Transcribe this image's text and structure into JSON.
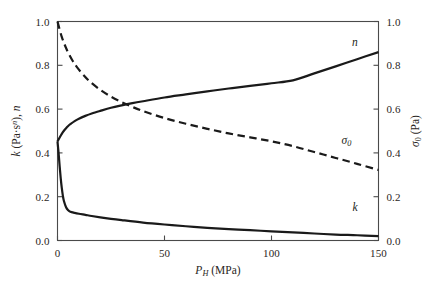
{
  "chart_data": {
    "type": "line",
    "title": "",
    "subtitle": "",
    "xlabel": "P_H (MPa)",
    "ylabel": "k (Pa·s^n), n",
    "y2label": "σ₀ (Pa)",
    "xlim": [
      0,
      150
    ],
    "ylim": [
      0.0,
      1.0
    ],
    "y2lim": [
      0.0,
      1.0
    ],
    "grid": false,
    "legend": "none",
    "legend_position": "inline-annotations",
    "xticks": [
      0,
      50,
      100,
      150
    ],
    "xtick_labels": [
      "0",
      "50",
      "100",
      "150"
    ],
    "yticks": [
      0.0,
      0.2,
      0.4,
      0.6,
      0.8,
      1.0
    ],
    "ytick_labels": [
      "0.0",
      "0.2",
      "0.4",
      "0.6",
      "0.8",
      "1.0"
    ],
    "y2ticks": [
      0.0,
      0.2,
      0.4,
      0.6,
      0.8,
      1.0
    ],
    "y2tick_labels": [
      "0.0",
      "0.2",
      "0.4",
      "0.6",
      "0.8",
      "1.0"
    ],
    "series": [
      {
        "name": "n",
        "style": "solid",
        "color": "#1a1a1a",
        "axis": "left",
        "x": [
          0,
          1,
          2,
          3,
          4,
          5,
          6,
          8,
          10,
          13,
          16,
          20,
          25,
          30,
          35,
          40,
          50,
          60,
          70,
          80,
          90,
          100,
          110,
          120,
          130,
          140,
          150
        ],
        "values": [
          0.452,
          0.47,
          0.487,
          0.501,
          0.513,
          0.523,
          0.531,
          0.545,
          0.556,
          0.569,
          0.58,
          0.592,
          0.606,
          0.617,
          0.627,
          0.636,
          0.653,
          0.667,
          0.681,
          0.694,
          0.706,
          0.718,
          0.731,
          0.763,
          0.795,
          0.828,
          0.86
        ]
      },
      {
        "name": "σ₀",
        "style": "dashed",
        "color": "#1a1a1a",
        "axis": "right",
        "x": [
          0,
          1,
          2,
          3,
          4,
          5,
          7,
          9,
          12,
          15,
          20,
          25,
          30,
          35,
          40,
          50,
          60,
          70,
          80,
          90,
          100,
          110,
          120,
          130,
          140,
          150
        ],
        "values": [
          1.0,
          0.963,
          0.93,
          0.903,
          0.879,
          0.858,
          0.822,
          0.793,
          0.757,
          0.727,
          0.688,
          0.657,
          0.632,
          0.61,
          0.591,
          0.559,
          0.533,
          0.51,
          0.489,
          0.471,
          0.453,
          0.431,
          0.404,
          0.377,
          0.35,
          0.322
        ]
      },
      {
        "name": "k",
        "style": "solid",
        "color": "#1a1a1a",
        "axis": "left",
        "x": [
          0,
          0.5,
          1,
          1.5,
          2,
          2.5,
          3,
          4,
          5,
          6,
          8,
          10,
          13,
          16,
          20,
          25,
          30,
          40,
          50,
          60,
          70,
          80,
          90,
          100,
          110,
          120,
          130,
          140,
          150
        ],
        "values": [
          0.452,
          0.4,
          0.34,
          0.285,
          0.24,
          0.205,
          0.18,
          0.152,
          0.138,
          0.131,
          0.126,
          0.122,
          0.117,
          0.112,
          0.106,
          0.099,
          0.093,
          0.082,
          0.073,
          0.065,
          0.058,
          0.052,
          0.047,
          0.042,
          0.037,
          0.032,
          0.027,
          0.024,
          0.02
        ]
      }
    ],
    "annotations": [
      {
        "text": "n",
        "x": 139,
        "y_left": 0.905,
        "style": "italic"
      },
      {
        "text": "σ₀",
        "x": 135,
        "y_left": 0.455,
        "style": "italic"
      },
      {
        "text": "k",
        "x": 139,
        "y_left": 0.155,
        "style": "italic"
      }
    ]
  },
  "axes": {
    "x_title_main": "P",
    "x_title_sub": "H",
    "x_title_unit": " (MPa)",
    "y_left_part1": "k",
    "y_left_part2": " (Pa·s",
    "y_left_sup": "n",
    "y_left_part3": "), ",
    "y_left_part4": "n",
    "y_right_part1": "σ",
    "y_right_sub": "0",
    "y_right_part2": " (Pa)"
  },
  "colors": {
    "ink": "#231f20",
    "curve": "#1a1a1a",
    "frame": "#4a4a4a",
    "background": "#ffffff"
  }
}
